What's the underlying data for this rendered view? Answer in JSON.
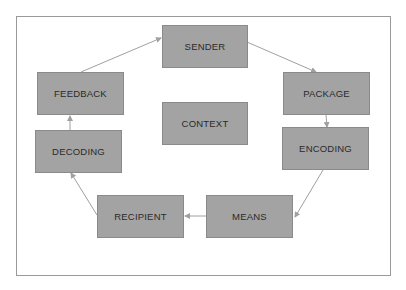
{
  "diagram": {
    "type": "communication-process-cycle",
    "colors": {
      "box_fill": "#a3a3a3",
      "box_border": "#8a8a8a",
      "arrow": "#a0a0a0",
      "frame": "#9a9a9a",
      "text": "#2a2a2a"
    },
    "nodes": [
      {
        "id": "sender",
        "label": "SENDER"
      },
      {
        "id": "package",
        "label": "PACKAGE"
      },
      {
        "id": "encoding",
        "label": "ENCODING"
      },
      {
        "id": "means",
        "label": "MEANS"
      },
      {
        "id": "recipient",
        "label": "RECIPIENT"
      },
      {
        "id": "decoding",
        "label": "DECODING"
      },
      {
        "id": "feedback",
        "label": "FEEDBACK"
      },
      {
        "id": "context",
        "label": "CONTEXT"
      }
    ],
    "edges": [
      {
        "from": "sender",
        "to": "package"
      },
      {
        "from": "package",
        "to": "encoding"
      },
      {
        "from": "encoding",
        "to": "means"
      },
      {
        "from": "means",
        "to": "recipient"
      },
      {
        "from": "recipient",
        "to": "decoding"
      },
      {
        "from": "decoding",
        "to": "feedback"
      },
      {
        "from": "feedback",
        "to": "sender"
      }
    ]
  }
}
